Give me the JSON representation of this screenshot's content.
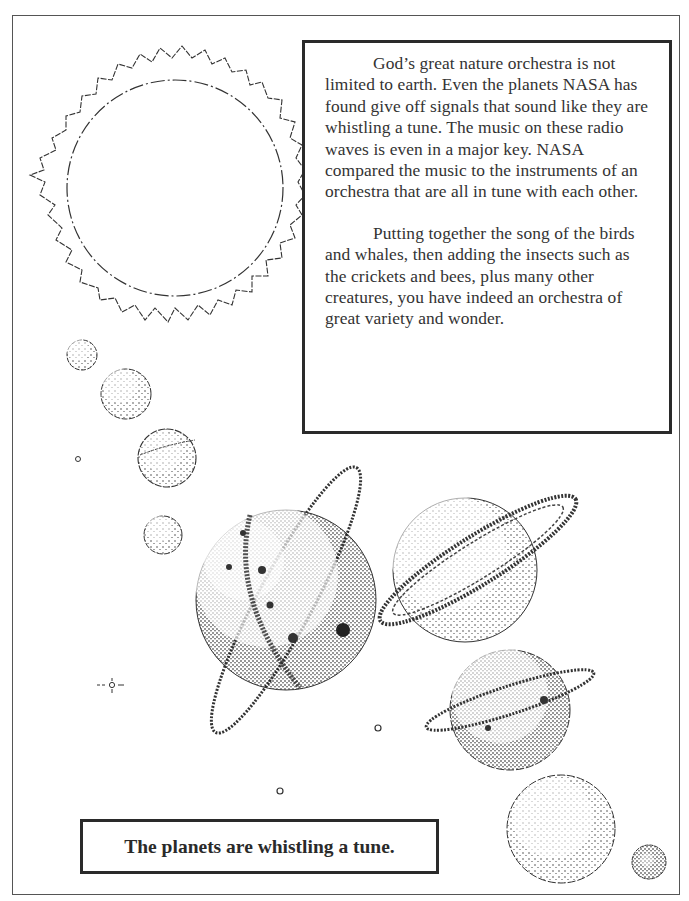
{
  "text_box": {
    "paragraphs": [
      "God’s great nature orchestra is not limited to earth. Even the planets NASA has found give off signals that sound like they are whistling a tune. The music on these radio waves is even in a major key. NASA compared the music to the instruments of an orchestra that are all in tune with each other.",
      "Putting together the song of the birds and whales, then adding the insects such as the crickets and bees, plus many other creatures,  you have indeed an orchestra of great variety and wonder."
    ]
  },
  "caption": {
    "text": "The planets are whistling a tune."
  },
  "illustration": {
    "sun": {
      "cx": 175,
      "cy": 188,
      "r": 108,
      "ray_outer": 142
    },
    "planets": [
      {
        "name": "small-planet-1",
        "cx": 82,
        "cy": 355,
        "r": 15
      },
      {
        "name": "small-planet-2",
        "cx": 126,
        "cy": 394,
        "r": 25
      },
      {
        "name": "small-planet-3",
        "cx": 167,
        "cy": 458,
        "r": 29
      },
      {
        "name": "small-planet-4",
        "cx": 163,
        "cy": 535,
        "r": 19
      },
      {
        "name": "ringed-planet-large",
        "cx": 286,
        "cy": 600,
        "r": 90
      },
      {
        "name": "ringed-planet-saturn",
        "cx": 465,
        "cy": 570,
        "r": 72
      },
      {
        "name": "ringed-planet-medium",
        "cx": 510,
        "cy": 710,
        "r": 60
      },
      {
        "name": "planet-large-lower",
        "cx": 561,
        "cy": 829,
        "r": 54
      },
      {
        "name": "planet-tiny-corner",
        "cx": 649,
        "cy": 862,
        "r": 17
      }
    ],
    "stars": [
      {
        "cx": 78,
        "cy": 459,
        "r": 2.5
      },
      {
        "cx": 112,
        "cy": 685,
        "r": 3,
        "sparkle": true
      },
      {
        "cx": 378,
        "cy": 728,
        "r": 3
      },
      {
        "cx": 280,
        "cy": 791,
        "r": 3
      }
    ],
    "colors": {
      "ink": "#2a2a2a",
      "paper": "#ffffff"
    }
  }
}
